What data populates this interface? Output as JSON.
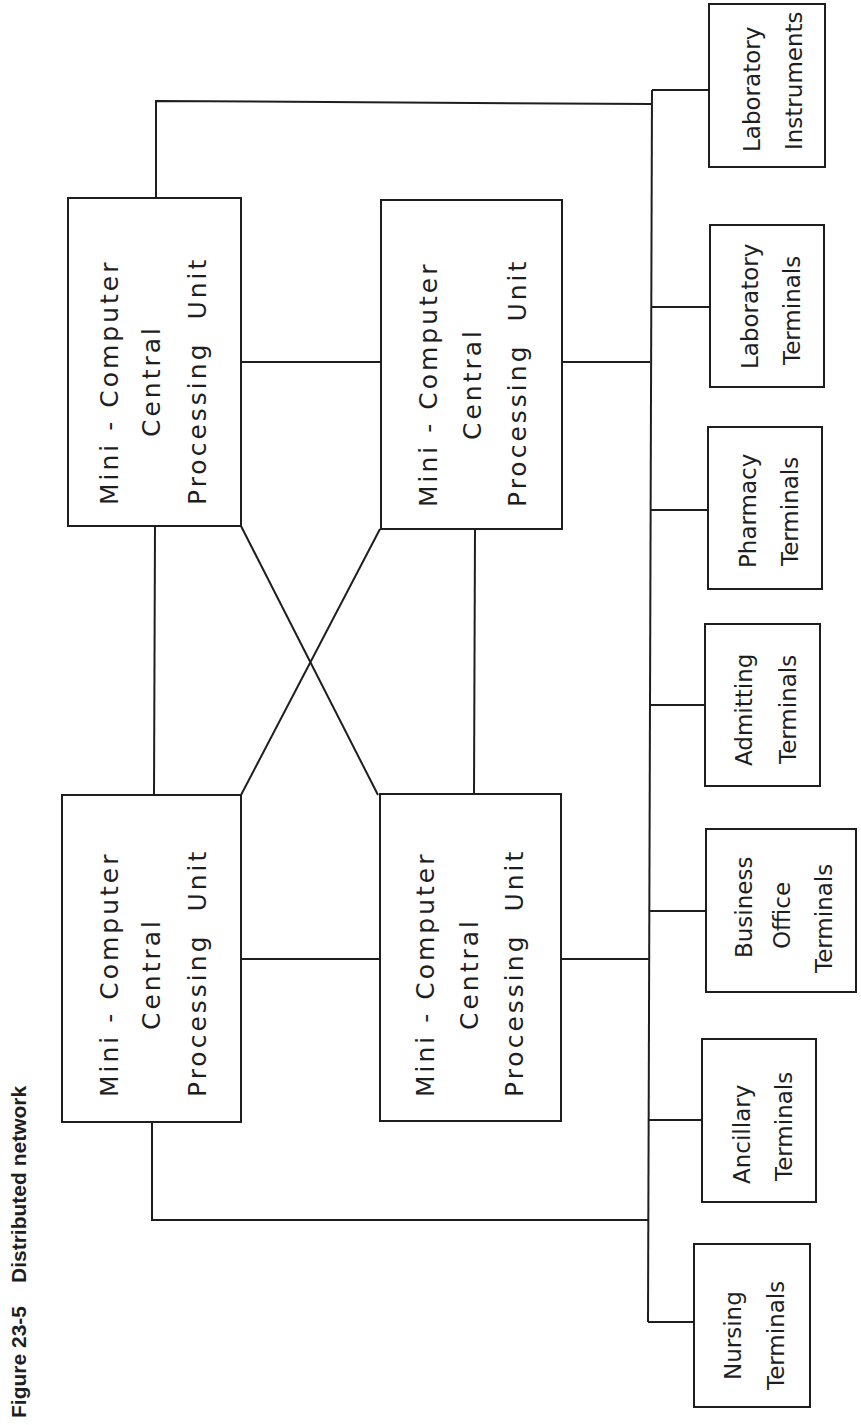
{
  "caption": {
    "figure_number": "Figure 23-5",
    "title": "Distributed network"
  },
  "cpus": [
    {
      "id": "cpu-top-left",
      "lines": [
        "Mini - Computer",
        "Central",
        "Processing  Unit"
      ]
    },
    {
      "id": "cpu-top-right",
      "lines": [
        "Mini - Computer",
        "Central",
        "Processing  Unit"
      ]
    },
    {
      "id": "cpu-bottom-left",
      "lines": [
        "Mini - Computer",
        "Central",
        "Processing  Unit"
      ]
    },
    {
      "id": "cpu-bottom-right",
      "lines": [
        "Mini - Computer",
        "Central",
        "Processing  Unit"
      ]
    }
  ],
  "terminals": [
    {
      "id": "laboratory-instruments",
      "lines": [
        "Laboratory",
        "Instruments"
      ]
    },
    {
      "id": "laboratory-terminals",
      "lines": [
        "Laboratory",
        "Terminals"
      ]
    },
    {
      "id": "pharmacy-terminals",
      "lines": [
        "Pharmacy",
        "Terminals"
      ]
    },
    {
      "id": "admitting-terminals",
      "lines": [
        "Admitting",
        "Terminals"
      ]
    },
    {
      "id": "business-office-terminals",
      "lines": [
        "Business",
        "Office",
        "Terminals"
      ]
    },
    {
      "id": "ancillary-terminals",
      "lines": [
        "Ancillary",
        "Terminals"
      ]
    },
    {
      "id": "nursing-terminals",
      "lines": [
        "Nursing",
        "Terminals"
      ]
    }
  ],
  "colors": {
    "ink": "#1e1e1e",
    "background": "#ffffff"
  }
}
